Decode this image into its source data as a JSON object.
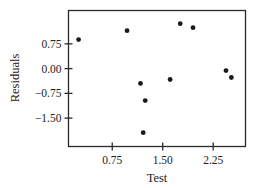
{
  "chart_data": {
    "type": "scatter",
    "title": "",
    "xlabel": "Test",
    "ylabel": "Residuals",
    "xlim": [
      0.1,
      2.73
    ],
    "ylim": [
      -2.36,
      1.76
    ],
    "xticks": [
      0.75,
      1.5,
      2.25
    ],
    "xtick_labels": [
      "0.75",
      "1.50",
      "2.25"
    ],
    "yticks": [
      0.75,
      0.0,
      -0.75,
      -1.5
    ],
    "ytick_labels": [
      "0.75",
      "0.00",
      "−0.75",
      "−1.50"
    ],
    "grid": false,
    "legend": null,
    "series": [
      {
        "name": "Residuals",
        "marker_color": "#1a1a1a",
        "points": [
          {
            "x": 0.25,
            "y": 0.88
          },
          {
            "x": 0.97,
            "y": 1.15
          },
          {
            "x": 1.17,
            "y": -0.45
          },
          {
            "x": 1.21,
            "y": -1.94
          },
          {
            "x": 1.24,
            "y": -0.97
          },
          {
            "x": 1.61,
            "y": -0.33
          },
          {
            "x": 1.76,
            "y": 1.36
          },
          {
            "x": 1.95,
            "y": 1.24
          },
          {
            "x": 2.44,
            "y": -0.06
          },
          {
            "x": 2.52,
            "y": -0.27
          }
        ]
      }
    ]
  }
}
